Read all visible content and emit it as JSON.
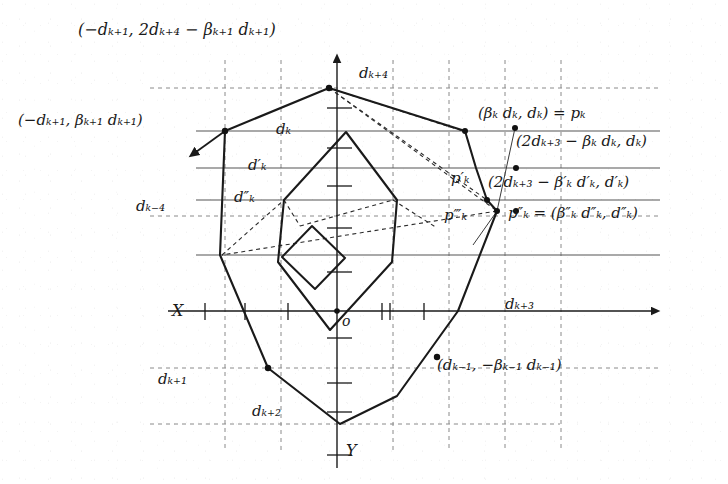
{
  "figure": {
    "type": "geometric-diagram",
    "axes": {
      "x_label": "X",
      "y_label": "Y",
      "origin_label": "o",
      "x_axis_y_px": 311,
      "y_axis_x_px": 337,
      "x_axis_x_from_px": 168,
      "x_axis_x_to_px": 660,
      "y_axis_y_from_px": 68,
      "y_axis_y_to_px": 468
    },
    "colors": {
      "ink": "#1a1a1a",
      "grid_dashed": "#777777",
      "grid_solid": "#555555",
      "paper": "#ffffff"
    },
    "grid": {
      "dashed_vertical_x_px": [
        225,
        281,
        337,
        393,
        449,
        505,
        561
      ],
      "dashed_horizontal_y_px": [
        88,
        216,
        368,
        424
      ],
      "solid_horizontal_y_px": [
        131,
        168,
        200,
        255,
        311
      ]
    },
    "tick_marks_count": 12
  },
  "labels": {
    "top_point": "(−dₖ₊₁, 2dₖ₊₄ − βₖ₊₁ dₖ₊₁)",
    "left_point": "(−dₖ₊₁, βₖ₊₁ dₖ₊₁)",
    "pk": "(βₖ dₖ, dₖ) = pₖ",
    "pk_mirror": "(2dₖ₊₃ − βₖ dₖ, dₖ)",
    "pk_prime": "p′ₖ",
    "pk_prime_mirror": "(2dₖ₊₃ − β′ₖ d′ₖ, d′ₖ)",
    "pk_triple_prime": "p‴ₖ",
    "pk_double_prime": "p″ₖ = (β″ₖ d″ₖ, d″ₖ)",
    "d_k": "dₖ",
    "d_k_prime": "d′ₖ",
    "d_k_double_prime": "d″ₖ",
    "d_k_minus_4": "dₖ₋₄",
    "d_k_plus_1": "dₖ₊₁",
    "d_k_plus_2": "dₖ₊₂",
    "d_k_plus_3": "dₖ₊₃",
    "d_k_plus_4": "dₖ₊₄",
    "bottom_right_point": "(dₖ₋₁, −βₖ₋₁ dₖ₋₁)",
    "x_axis": "X",
    "y_axis": "Y",
    "origin": "o"
  },
  "geometry": {
    "outer_polygon": [
      [
        329,
        88
      ],
      [
        465,
        131
      ],
      [
        476,
        168
      ],
      [
        487,
        200
      ],
      [
        497,
        211
      ],
      [
        458,
        311
      ],
      [
        397,
        396
      ],
      [
        340,
        424
      ],
      [
        268,
        368
      ],
      [
        220,
        255
      ],
      [
        225,
        219
      ]
    ],
    "middle_polygon": [
      [
        284,
        200
      ],
      [
        346,
        132
      ],
      [
        397,
        200
      ],
      [
        392,
        262
      ],
      [
        330,
        330
      ],
      [
        278,
        262
      ]
    ],
    "inner_polygon": [
      [
        282,
        257
      ],
      [
        312,
        226
      ],
      [
        345,
        258
      ],
      [
        315,
        289
      ]
    ],
    "dashed_polyline_a": [
      [
        329,
        88
      ],
      [
        497,
        211
      ],
      [
        222,
        255
      ],
      [
        284,
        200
      ]
    ],
    "dashed_polyline_b": [
      [
        329,
        88
      ],
      [
        487,
        200
      ],
      [
        300,
        225
      ]
    ],
    "thin_connector": [
      [
        497,
        211
      ],
      [
        515,
        128
      ]
    ],
    "marked_vertices": [
      [
        329,
        88
      ],
      [
        225,
        131
      ],
      [
        465,
        131
      ],
      [
        487,
        200
      ],
      [
        497,
        211
      ],
      [
        515,
        128
      ],
      [
        516,
        168
      ],
      [
        516,
        211
      ],
      [
        268,
        368
      ],
      [
        437,
        357
      ],
      [
        337,
        311
      ]
    ]
  }
}
